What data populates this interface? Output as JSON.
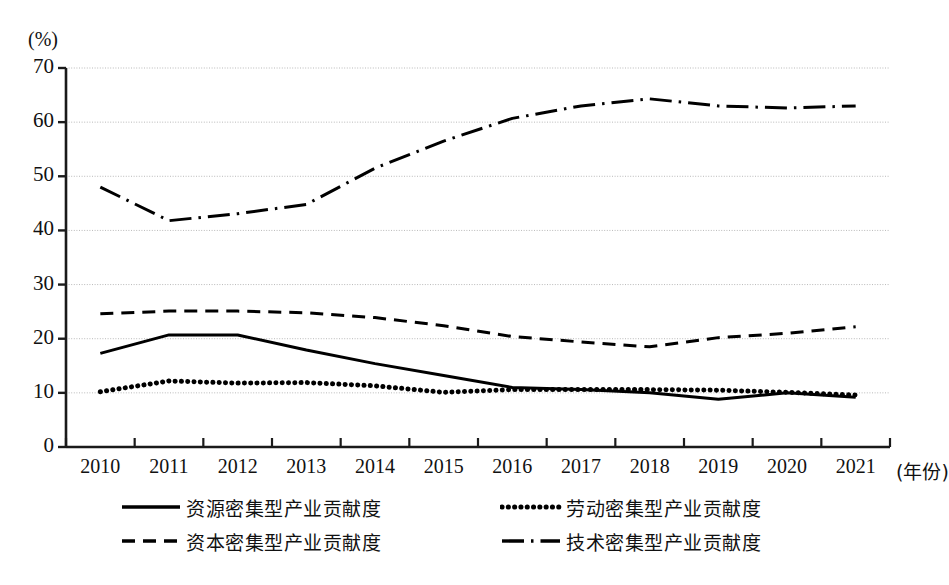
{
  "axis": {
    "y_unit": "(%)",
    "x_unit": "(年份)",
    "y_ticks": [
      "0",
      "10",
      "20",
      "30",
      "40",
      "50",
      "60",
      "70"
    ],
    "x_ticks": [
      "2010",
      "2011",
      "2012",
      "2013",
      "2014",
      "2015",
      "2016",
      "2017",
      "2018",
      "2019",
      "2020",
      "2021"
    ]
  },
  "legend": {
    "items": [
      {
        "label": "资源密集型产业贡献度",
        "style": "solid"
      },
      {
        "label": "劳动密集型产业贡献度",
        "style": "dotted"
      },
      {
        "label": "资本密集型产业贡献度",
        "style": "dashed"
      },
      {
        "label": "技术密集型产业贡献度",
        "style": "dashdot"
      }
    ]
  },
  "chart_data": {
    "type": "line",
    "title": "",
    "xlabel": "(年份)",
    "ylabel": "(%)",
    "xlim": [
      2010,
      2021
    ],
    "ylim": [
      0,
      70
    ],
    "grid": true,
    "legend_position": "bottom",
    "categories": [
      "2010",
      "2011",
      "2012",
      "2013",
      "2014",
      "2015",
      "2016",
      "2017",
      "2018",
      "2019",
      "2020",
      "2021"
    ],
    "series": [
      {
        "name": "资源密集型产业贡献度",
        "style": "solid",
        "color": "#000000",
        "values": [
          17.3,
          20.7,
          20.7,
          17.9,
          15.4,
          13.2,
          11.0,
          10.6,
          10.0,
          8.8,
          10.0,
          9.2
        ]
      },
      {
        "name": "劳动密集型产业贡献度",
        "style": "dotted",
        "color": "#000000",
        "values": [
          10.2,
          12.2,
          11.8,
          11.9,
          11.3,
          10.1,
          10.6,
          10.6,
          10.6,
          10.5,
          10.1,
          9.6
        ]
      },
      {
        "name": "资本密集型产业贡献度",
        "style": "dashed",
        "color": "#000000",
        "values": [
          24.6,
          25.1,
          25.1,
          24.8,
          23.9,
          22.4,
          20.4,
          19.4,
          18.5,
          20.2,
          21.0,
          22.2
        ]
      },
      {
        "name": "技术密集型产业贡献度",
        "style": "dashdot",
        "color": "#000000",
        "values": [
          48.0,
          41.8,
          43.1,
          44.8,
          51.5,
          56.5,
          60.7,
          63.0,
          64.3,
          63.0,
          62.6,
          63.0
        ]
      }
    ]
  }
}
